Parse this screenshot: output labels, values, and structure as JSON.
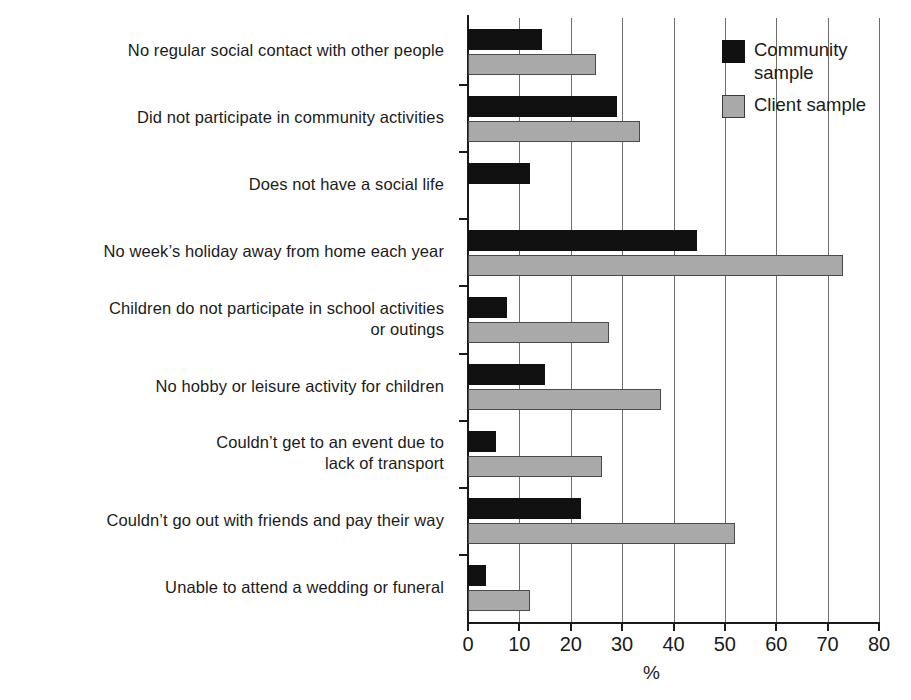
{
  "chart_data": {
    "type": "bar",
    "orientation": "horizontal",
    "title": "",
    "xlabel": "%",
    "ylabel": "",
    "xlim": [
      0,
      80
    ],
    "xticks": [
      0,
      10,
      20,
      30,
      40,
      50,
      60,
      70,
      80
    ],
    "grid": "vertical",
    "legend_position": "top-right",
    "categories": [
      "No regular social contact with other people",
      "Did not participate in community activities",
      "Does not have a social life",
      "No week’s holiday away from home each year",
      "Children do not participate in school activities\nor outings",
      "No hobby or leisure activity for children",
      "Couldn’t get to an event due to\nlack of transport",
      "Couldn’t go out with friends and pay their way",
      "Unable to attend a wedding or funeral"
    ],
    "series": [
      {
        "name": "Community sample",
        "color": "#111111",
        "values": [
          14.5,
          29,
          12,
          44.5,
          7.5,
          15,
          5.5,
          22,
          3.5
        ]
      },
      {
        "name": "Client sample",
        "color": "#a9a9a9",
        "values": [
          25,
          33.5,
          0,
          73,
          27.5,
          37.5,
          26,
          52,
          12
        ]
      }
    ]
  },
  "legend": {
    "items": [
      {
        "label": "Community\nsample",
        "swatch": "community-swatch"
      },
      {
        "label": "Client sample",
        "swatch": "client-swatch"
      }
    ]
  },
  "axis": {
    "x_title": "%",
    "tick_labels": [
      "0",
      "10",
      "20",
      "30",
      "40",
      "50",
      "60",
      "70",
      "80"
    ]
  }
}
